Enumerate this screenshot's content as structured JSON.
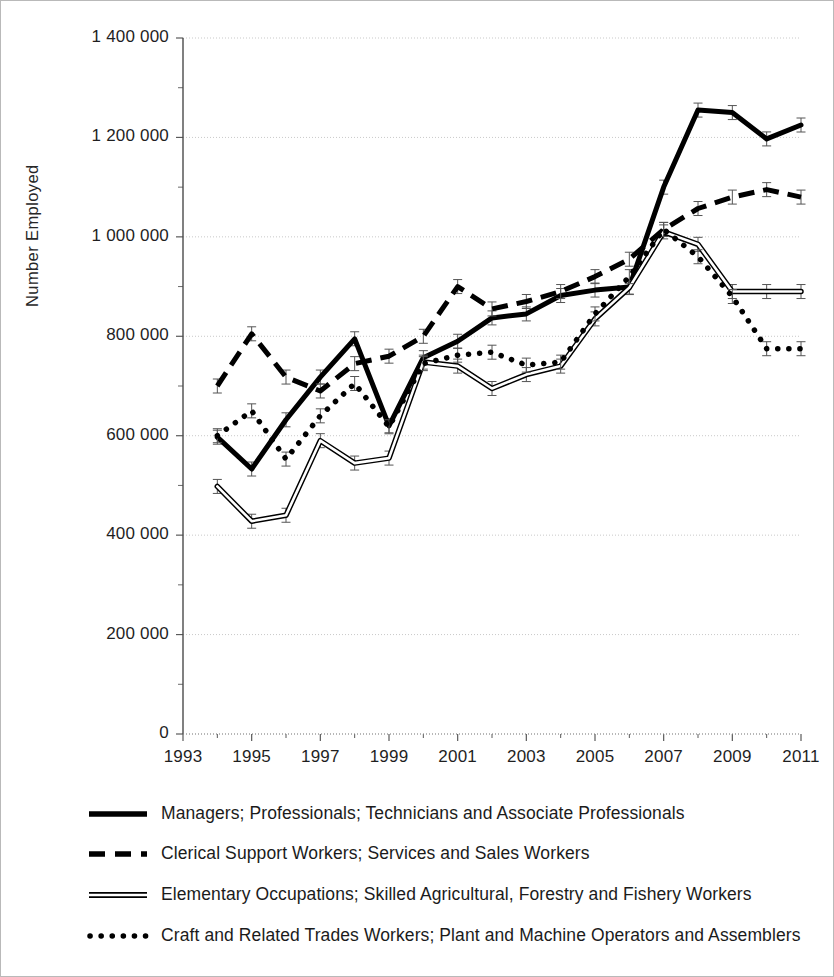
{
  "chart_data": {
    "type": "line",
    "title": "",
    "xlabel": "",
    "ylabel": "Number Employed",
    "x": [
      1994,
      1995,
      1996,
      1997,
      1998,
      1999,
      2000,
      2001,
      2002,
      2003,
      2004,
      2005,
      2006,
      2007,
      2008,
      2009,
      2010,
      2011
    ],
    "xlim": [
      1993,
      2011
    ],
    "ylim": [
      0,
      1400000
    ],
    "xtick_labels": [
      "1993",
      "1995",
      "1997",
      "1999",
      "2001",
      "2003",
      "2005",
      "2007",
      "2009",
      "2011"
    ],
    "xtick_values": [
      1993,
      1995,
      1997,
      1999,
      2001,
      2003,
      2005,
      2007,
      2009,
      2011
    ],
    "xtick_minor_step": 1,
    "ytick_labels": [
      "0",
      "200 000",
      "400 000",
      "600 000",
      "800 000",
      "1 000 000",
      "1 200 000",
      "1 400 000"
    ],
    "ytick_values": [
      0,
      200000,
      400000,
      600000,
      800000,
      1000000,
      1200000,
      1400000
    ],
    "ytick_minor_step": 100000,
    "grid": "horizontal",
    "legend_position": "below",
    "error_bars": true,
    "series": [
      {
        "name": "Managers; Professionals; Technicians and Associate Professionals",
        "style": "solid-thick",
        "color": "#000000",
        "values": [
          597000,
          533000,
          632000,
          718000,
          795000,
          620000,
          757000,
          790000,
          837000,
          845000,
          882000,
          893000,
          899000,
          1100000,
          1255000,
          1250000,
          1197000,
          1225000
        ]
      },
      {
        "name": "Clerical Support Workers; Services and Sales Workers",
        "style": "dashed",
        "color": "#000000",
        "values": [
          700000,
          805000,
          718000,
          690000,
          745000,
          760000,
          800000,
          900000,
          855000,
          870000,
          890000,
          920000,
          955000,
          1015000,
          1057000,
          1080000,
          1095000,
          1080000
        ]
      },
      {
        "name": "Elementary Occupations; Skilled Agricultural, Forestry and Fishery Workers",
        "style": "double-outline",
        "color": "#000000",
        "values": [
          498000,
          428000,
          440000,
          590000,
          545000,
          555000,
          748000,
          740000,
          695000,
          723000,
          740000,
          835000,
          898000,
          1010000,
          985000,
          890000,
          890000,
          890000
        ]
      },
      {
        "name": "Craft and Related Trades Workers; Plant and Machine Operators and Assemblers",
        "style": "dotted",
        "color": "#000000",
        "values": [
          600000,
          650000,
          553000,
          640000,
          705000,
          618000,
          745000,
          762000,
          768000,
          742000,
          748000,
          845000,
          920000,
          1015000,
          960000,
          880000,
          775000,
          775000
        ]
      }
    ]
  },
  "legend": {
    "items": [
      {
        "label": "Managers; Professionals; Technicians and Associate Professionals",
        "style": "solid-thick"
      },
      {
        "label": "Clerical Support Workers; Services and Sales Workers",
        "style": "dashed"
      },
      {
        "label": "Elementary Occupations; Skilled Agricultural, Forestry and Fishery Workers",
        "style": "double-outline"
      },
      {
        "label": "Craft and Related Trades Workers; Plant and Machine Operators and Assemblers",
        "style": "dotted"
      }
    ]
  },
  "axis": {
    "y_title": "Number Employed"
  }
}
